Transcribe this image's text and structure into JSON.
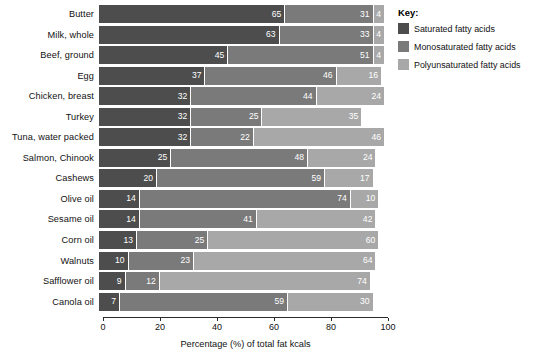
{
  "chart_data": {
    "type": "bar",
    "orientation": "horizontal",
    "stacked": true,
    "title": "",
    "xlabel": "Percentage (%) of total fat kcals",
    "ylabel": "",
    "xlim": [
      0,
      100
    ],
    "xticks": [
      0,
      20,
      40,
      60,
      80,
      100
    ],
    "xtick_labels": [
      "0",
      "20",
      "40",
      "60",
      "80",
      "100"
    ],
    "grid": false,
    "legend_position": "right",
    "legend_title": "Key:",
    "categories": [
      "Butter",
      "Milk, whole",
      "Beef, ground",
      "Egg",
      "Chicken, breast",
      "Turkey",
      "Tuna, water packed",
      "Salmon, Chinook",
      "Cashews",
      "Olive oil",
      "Sesame oil",
      "Corn oil",
      "Walnuts",
      "Safflower oil",
      "Canola oil"
    ],
    "series": [
      {
        "name": "Saturated fatty acids",
        "color": "#4d4d4d",
        "values": [
          65,
          63,
          45,
          37,
          32,
          32,
          32,
          25,
          20,
          14,
          14,
          13,
          10,
          9,
          7
        ]
      },
      {
        "name": "Monosaturated fatty acids",
        "color": "#7a7a7a",
        "values": [
          31,
          33,
          51,
          46,
          44,
          25,
          22,
          48,
          59,
          74,
          41,
          25,
          23,
          12,
          59
        ]
      },
      {
        "name": "Polyunsaturated fatty acids",
        "color": "#a8a8a8",
        "values": [
          4,
          4,
          4,
          16,
          24,
          35,
          46,
          24,
          17,
          10,
          42,
          60,
          64,
          74,
          30
        ]
      }
    ]
  },
  "rows": [
    {
      "label": "Butter",
      "segments": [
        {
          "value": 65,
          "class": "sat"
        },
        {
          "value": 31,
          "class": "mono"
        },
        {
          "value": 4,
          "class": "poly"
        }
      ]
    },
    {
      "label": "Milk, whole",
      "segments": [
        {
          "value": 63,
          "class": "sat"
        },
        {
          "value": 33,
          "class": "mono"
        },
        {
          "value": 4,
          "class": "poly"
        }
      ]
    },
    {
      "label": "Beef, ground",
      "segments": [
        {
          "value": 45,
          "class": "sat"
        },
        {
          "value": 51,
          "class": "mono"
        },
        {
          "value": 4,
          "class": "poly"
        }
      ]
    },
    {
      "label": "Egg",
      "segments": [
        {
          "value": 37,
          "class": "sat"
        },
        {
          "value": 46,
          "class": "mono"
        },
        {
          "value": 16,
          "class": "poly"
        }
      ]
    },
    {
      "label": "Chicken, breast",
      "segments": [
        {
          "value": 32,
          "class": "sat"
        },
        {
          "value": 44,
          "class": "mono"
        },
        {
          "value": 24,
          "class": "poly"
        }
      ]
    },
    {
      "label": "Turkey",
      "segments": [
        {
          "value": 32,
          "class": "sat"
        },
        {
          "value": 25,
          "class": "mono"
        },
        {
          "value": 35,
          "class": "poly"
        }
      ]
    },
    {
      "label": "Tuna, water packed",
      "segments": [
        {
          "value": 32,
          "class": "sat"
        },
        {
          "value": 22,
          "class": "mono"
        },
        {
          "value": 46,
          "class": "poly"
        }
      ]
    },
    {
      "label": "Salmon, Chinook",
      "segments": [
        {
          "value": 25,
          "class": "sat"
        },
        {
          "value": 48,
          "class": "mono"
        },
        {
          "value": 24,
          "class": "poly"
        }
      ]
    },
    {
      "label": "Cashews",
      "segments": [
        {
          "value": 20,
          "class": "sat"
        },
        {
          "value": 59,
          "class": "mono"
        },
        {
          "value": 17,
          "class": "poly"
        }
      ]
    },
    {
      "label": "Olive oil",
      "segments": [
        {
          "value": 14,
          "class": "sat"
        },
        {
          "value": 74,
          "class": "mono"
        },
        {
          "value": 10,
          "class": "poly"
        }
      ]
    },
    {
      "label": "Sesame oil",
      "segments": [
        {
          "value": 14,
          "class": "sat"
        },
        {
          "value": 41,
          "class": "mono"
        },
        {
          "value": 42,
          "class": "poly"
        }
      ]
    },
    {
      "label": "Corn oil",
      "segments": [
        {
          "value": 13,
          "class": "sat"
        },
        {
          "value": 25,
          "class": "mono"
        },
        {
          "value": 60,
          "class": "poly"
        }
      ]
    },
    {
      "label": "Walnuts",
      "segments": [
        {
          "value": 10,
          "class": "sat"
        },
        {
          "value": 23,
          "class": "mono"
        },
        {
          "value": 64,
          "class": "poly"
        }
      ]
    },
    {
      "label": "Safflower oil",
      "segments": [
        {
          "value": 9,
          "class": "sat"
        },
        {
          "value": 12,
          "class": "mono"
        },
        {
          "value": 74,
          "class": "poly"
        }
      ]
    },
    {
      "label": "Canola oil",
      "segments": [
        {
          "value": 7,
          "class": "sat"
        },
        {
          "value": 59,
          "class": "mono"
        },
        {
          "value": 30,
          "class": "poly"
        }
      ]
    }
  ],
  "axis": {
    "ticks": [
      "0",
      "20",
      "40",
      "60",
      "80",
      "100"
    ],
    "title": "Percentage (%) of total fat kcals"
  },
  "legend": {
    "title": "Key:",
    "items": [
      {
        "label": "Saturated fatty acids",
        "color": "#4d4d4d",
        "class": "sat"
      },
      {
        "label": "Monosaturated fatty acids",
        "color": "#7a7a7a",
        "class": "mono"
      },
      {
        "label": "Polyunsaturated fatty acids",
        "color": "#a8a8a8",
        "class": "poly"
      }
    ]
  }
}
